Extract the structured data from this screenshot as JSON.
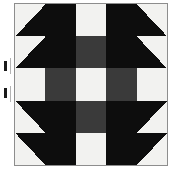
{
  "figure": {
    "width": 181,
    "height": 177
  },
  "colors": {
    "dark": "#0d0d0d",
    "gray": "#3a3a3a",
    "light": "#f2f2f0",
    "background": "#ffffff",
    "frame_line": "#8d8d8d",
    "tick": "#1a1a1a"
  },
  "block": {
    "name": "five-patch-quilt-block",
    "frame": {
      "x": 14,
      "y": 3,
      "width": 154,
      "height": 163
    },
    "grid": {
      "rows": 5,
      "cols": 5,
      "cell_width": 30.8,
      "cell_height": 32.6
    },
    "cells": [
      [
        {
          "type": "half-square-triangle",
          "orientation": "tl",
          "fill_a": "light",
          "fill_b": "dark"
        },
        {
          "type": "half-square-triangle",
          "orientation": "bl",
          "fill_a": "dark",
          "fill_b": "dark"
        },
        {
          "type": "solid",
          "fill": "light"
        },
        {
          "type": "half-square-triangle",
          "orientation": "br",
          "fill_a": "dark",
          "fill_b": "dark"
        },
        {
          "type": "half-square-triangle",
          "orientation": "tr",
          "fill_a": "light",
          "fill_b": "dark"
        }
      ],
      [
        {
          "type": "half-square-triangle",
          "orientation": "tl",
          "fill_a": "light",
          "fill_b": "dark"
        },
        {
          "type": "solid",
          "fill": "dark"
        },
        {
          "type": "solid",
          "fill": "gray"
        },
        {
          "type": "solid",
          "fill": "dark"
        },
        {
          "type": "half-square-triangle",
          "orientation": "tr",
          "fill_a": "light",
          "fill_b": "dark"
        }
      ],
      [
        {
          "type": "solid",
          "fill": "light"
        },
        {
          "type": "solid",
          "fill": "gray"
        },
        {
          "type": "solid",
          "fill": "light"
        },
        {
          "type": "solid",
          "fill": "gray"
        },
        {
          "type": "solid",
          "fill": "light"
        }
      ],
      [
        {
          "type": "half-square-triangle",
          "orientation": "bl",
          "fill_a": "light",
          "fill_b": "dark"
        },
        {
          "type": "solid",
          "fill": "dark"
        },
        {
          "type": "solid",
          "fill": "gray"
        },
        {
          "type": "solid",
          "fill": "dark"
        },
        {
          "type": "half-square-triangle",
          "orientation": "br",
          "fill_a": "light",
          "fill_b": "dark"
        }
      ],
      [
        {
          "type": "half-square-triangle",
          "orientation": "bl",
          "fill_a": "light",
          "fill_b": "dark"
        },
        {
          "type": "half-square-triangle",
          "orientation": "tl",
          "fill_a": "dark",
          "fill_b": "dark"
        },
        {
          "type": "solid",
          "fill": "light"
        },
        {
          "type": "half-square-triangle",
          "orientation": "tr",
          "fill_a": "dark",
          "fill_b": "dark"
        },
        {
          "type": "half-square-triangle",
          "orientation": "br",
          "fill_a": "light",
          "fill_b": "dark"
        }
      ]
    ]
  },
  "markers": {
    "tick_upper": {
      "x": 4,
      "y": 61,
      "label": ""
    },
    "tick_lower": {
      "x": 4,
      "y": 88,
      "label": ""
    }
  }
}
